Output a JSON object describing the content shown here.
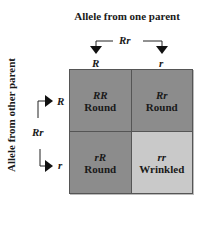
{
  "titles": {
    "top": "Allele from one parent",
    "side": "Allele from other parent"
  },
  "parents": {
    "top": {
      "genotype": "Rr",
      "alleles": [
        "R",
        "r"
      ]
    },
    "side": {
      "genotype": "Rr",
      "alleles": [
        "R",
        "r"
      ]
    }
  },
  "punnett": {
    "cells": [
      {
        "genotype": "RR",
        "phenotype": "Round",
        "color": "#8c8c8c"
      },
      {
        "genotype": "Rr",
        "phenotype": "Round",
        "color": "#8c8c8c"
      },
      {
        "genotype": "rR",
        "phenotype": "Round",
        "color": "#8c8c8c"
      },
      {
        "genotype": "rr",
        "phenotype": "Wrinkled",
        "color": "#c9c9c9"
      }
    ]
  }
}
